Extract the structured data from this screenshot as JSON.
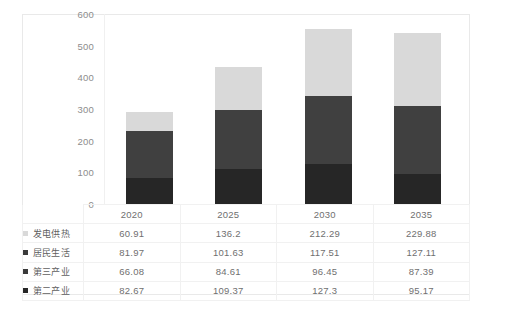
{
  "chart_data": {
    "type": "bar",
    "stacked": true,
    "title": "",
    "subtitle": "",
    "xlabel": "",
    "ylabel": "",
    "categories": [
      "2020",
      "2025",
      "2030",
      "2035"
    ],
    "ylim": [
      0,
      600
    ],
    "yticks": [
      0,
      100,
      200,
      300,
      400,
      500,
      600
    ],
    "ytick_labels": [
      "0",
      "100",
      "200",
      "300",
      "400",
      "500",
      "600"
    ],
    "grid": false,
    "legend_position": "table-left",
    "series": [
      {
        "name": "发电供热",
        "color": "#d9d9d9",
        "values": [
          60.91,
          136.2,
          212.29,
          229.88
        ],
        "value_labels": [
          "60.91",
          "136.2",
          "212.29",
          "229.88"
        ]
      },
      {
        "name": "居民生活",
        "color": "#404040",
        "values": [
          81.97,
          101.63,
          117.51,
          127.11
        ],
        "value_labels": [
          "81.97",
          "101.63",
          "117.51",
          "127.11"
        ]
      },
      {
        "name": "第三产业",
        "color": "#404040",
        "values": [
          66.08,
          84.61,
          96.45,
          87.39
        ],
        "value_labels": [
          "66.08",
          "84.61",
          "96.45",
          "87.39"
        ]
      },
      {
        "name": "第二产业",
        "color": "#262626",
        "values": [
          82.67,
          109.37,
          127.3,
          95.17
        ],
        "value_labels": [
          "82.67",
          "109.37",
          "127.3",
          "95.17"
        ]
      }
    ],
    "totals": [
      291.63,
      431.81,
      553.55,
      539.55
    ]
  },
  "legend": {
    "items": [
      {
        "label": "发电供热",
        "swatch": "#d9d9d9"
      },
      {
        "label": "居民生活",
        "swatch": "#3a3a3a"
      },
      {
        "label": "第三产业",
        "swatch": "#3a3a3a"
      },
      {
        "label": "第二产业",
        "swatch": "#262626"
      }
    ]
  },
  "table": {
    "year_row": [
      "2020",
      "2025",
      "2030",
      "2035"
    ],
    "rows": [
      {
        "label": "发电供热",
        "values": [
          "60.91",
          "136.2",
          "212.29",
          "229.88"
        ]
      },
      {
        "label": "居民生活",
        "values": [
          "81.97",
          "101.63",
          "117.51",
          "127.11"
        ]
      },
      {
        "label": "第三产业",
        "values": [
          "66.08",
          "84.61",
          "96.45",
          "87.39"
        ]
      },
      {
        "label": "第二产业",
        "values": [
          "82.67",
          "109.37",
          "127.3",
          "95.17"
        ]
      }
    ]
  },
  "colors": {
    "background": "#ffffff",
    "frame": "#e9e9e9",
    "gridline": "#f1f1f1",
    "axis_text": "#8d8d8d",
    "table_text": "#6f6f6f"
  }
}
